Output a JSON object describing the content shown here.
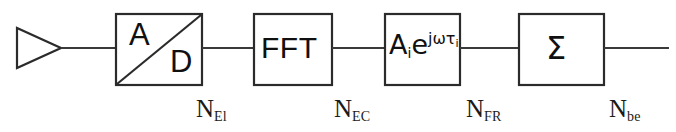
{
  "diagram": {
    "background_color": "#ffffff",
    "line_color": "#2b2b2b",
    "text_color": "#101010",
    "blocks": [
      {
        "id": "amplifier",
        "shape": "triangle",
        "label": "",
        "semantic": "amplifier / antenna element front-end"
      },
      {
        "id": "adc",
        "shape": "rect-with-diagonal",
        "label_top": "A",
        "label_bottom": "D",
        "semantic": "analog to digital converter"
      },
      {
        "id": "fft",
        "shape": "rect",
        "label": "FFT",
        "semantic": "fast fourier transform"
      },
      {
        "id": "phase-shift",
        "shape": "rect",
        "label_base": "A",
        "label_base_sub": "i",
        "label_exp_base": "e",
        "label_exp": "jωτ",
        "label_exp_sub": "i",
        "label_full": "Aᵢe^{jωτᵢ}",
        "semantic": "complex weight / phase shift"
      },
      {
        "id": "summer",
        "shape": "rect",
        "label": "Σ",
        "semantic": "summation"
      }
    ],
    "stage_labels": [
      {
        "id": "n-el",
        "base": "N",
        "sub": "El"
      },
      {
        "id": "n-ec",
        "base": "N",
        "sub": "EC"
      },
      {
        "id": "n-fr",
        "base": "N",
        "sub": "FR"
      },
      {
        "id": "n-be",
        "base": "N",
        "sub": "be"
      }
    ]
  }
}
